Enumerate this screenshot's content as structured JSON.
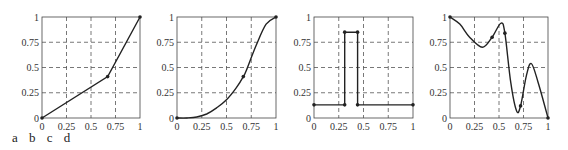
{
  "caption": [
    "a",
    "b",
    "c",
    "d"
  ],
  "chart_data": [
    {
      "type": "line",
      "title": "",
      "panel": "a",
      "xlabel": "",
      "ylabel": "",
      "xlim": [
        0,
        1
      ],
      "ylim": [
        0,
        1
      ],
      "xticks": [
        "0",
        "0.25",
        "0.5",
        "0.75",
        "1"
      ],
      "yticks": [
        "0",
        "0.25",
        "0.5",
        "0.75",
        "1"
      ],
      "grid": true,
      "x": [
        0,
        0.67,
        1
      ],
      "y": [
        0,
        0.41,
        1
      ],
      "knots": [
        [
          0,
          0
        ],
        [
          0.67,
          0.41
        ],
        [
          1,
          1
        ]
      ]
    },
    {
      "type": "line",
      "title": "",
      "panel": "b",
      "xlabel": "",
      "ylabel": "",
      "xlim": [
        0,
        1
      ],
      "ylim": [
        0,
        1
      ],
      "xticks": [
        "0",
        "0.25",
        "0.5",
        "0.75",
        "1"
      ],
      "yticks": [
        "0",
        "0.25",
        "0.5",
        "0.75",
        "1"
      ],
      "grid": true,
      "x": [
        0,
        0.1,
        0.2,
        0.3,
        0.4,
        0.5,
        0.6,
        0.67,
        0.7,
        0.8,
        0.9,
        1
      ],
      "y": [
        0,
        0.0,
        0.01,
        0.04,
        0.1,
        0.18,
        0.3,
        0.41,
        0.47,
        0.72,
        0.93,
        1
      ],
      "knots": [
        [
          0,
          0
        ],
        [
          0.67,
          0.41
        ],
        [
          1,
          1
        ]
      ]
    },
    {
      "type": "line",
      "title": "",
      "panel": "c",
      "xlabel": "",
      "ylabel": "",
      "xlim": [
        0,
        1
      ],
      "ylim": [
        0,
        1
      ],
      "xticks": [
        "0",
        "0.25",
        "0.5",
        "0.75",
        "1"
      ],
      "yticks": [
        "0",
        "0.25",
        "0.5",
        "0.75",
        "1"
      ],
      "grid": true,
      "x": [
        0,
        0.31,
        0.31,
        0.44,
        0.44,
        1
      ],
      "y": [
        0.13,
        0.13,
        0.85,
        0.85,
        0.13,
        0.13
      ],
      "knots": [
        [
          0,
          0.13
        ],
        [
          0.31,
          0.13
        ],
        [
          0.31,
          0.85
        ],
        [
          0.44,
          0.85
        ],
        [
          0.44,
          0.13
        ],
        [
          1,
          0.13
        ]
      ]
    },
    {
      "type": "line",
      "title": "",
      "panel": "d",
      "xlabel": "",
      "ylabel": "",
      "xlim": [
        0,
        1
      ],
      "ylim": [
        0,
        1
      ],
      "xticks": [
        "0",
        "0.25",
        "0.5",
        "0.75",
        "1"
      ],
      "yticks": [
        "0",
        "0.25",
        "0.5",
        "0.75",
        "1"
      ],
      "grid": true,
      "x": [
        0,
        0.1,
        0.2,
        0.33,
        0.43,
        0.52,
        0.56,
        0.62,
        0.68,
        0.72,
        0.78,
        0.83,
        0.9,
        1
      ],
      "y": [
        1,
        0.93,
        0.8,
        0.7,
        0.8,
        0.94,
        0.84,
        0.35,
        0.07,
        0.12,
        0.42,
        0.54,
        0.35,
        0
      ],
      "knots": [
        [
          0,
          1
        ],
        [
          0.43,
          0.8
        ],
        [
          0.56,
          0.84
        ],
        [
          0.72,
          0.12
        ],
        [
          1,
          0
        ]
      ]
    }
  ],
  "layout": {
    "panels": [
      {
        "x0": 42,
        "x1": 140
      },
      {
        "x0": 177,
        "x1": 276
      },
      {
        "x0": 314,
        "x1": 413
      },
      {
        "x0": 450,
        "x1": 548
      }
    ],
    "y_top": 17,
    "y_bottom": 118
  }
}
